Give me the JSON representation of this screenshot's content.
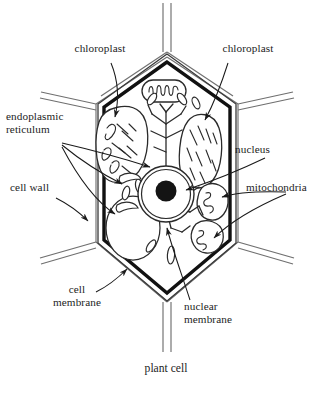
{
  "figure": {
    "title": "plant cell",
    "type": "biological-diagram",
    "subject": "plant cell",
    "background_color": "#ffffff",
    "ink_color": "#1a1a1a"
  },
  "labels": [
    {
      "id": "chloroplast-left",
      "text": "chloroplast",
      "points_to": "chloroplast"
    },
    {
      "id": "chloroplast-right",
      "text": "chloroplast",
      "points_to": "chloroplast"
    },
    {
      "id": "endoplasmic-reticulum",
      "text": "endoplasmic\nreticulum",
      "points_to": "endoplasmic reticulum"
    },
    {
      "id": "cell-wall",
      "text": "cell wall",
      "points_to": "cell wall"
    },
    {
      "id": "cell-membrane",
      "text": "cell\nmembrane",
      "points_to": "cell membrane"
    },
    {
      "id": "nucleus",
      "text": "nucleus",
      "points_to": "nucleus"
    },
    {
      "id": "mitochondria",
      "text": "mitochondria",
      "points_to": "mitochondria"
    },
    {
      "id": "nuclear-membrane",
      "text": "nuclear\nmembrane",
      "points_to": "nuclear membrane"
    }
  ],
  "caption": {
    "text": "plant cell"
  },
  "structures": {
    "cell_wall": "hexagonal outer wall shared with neighbouring cells",
    "cell_membrane": "thick dark line inside the cell wall",
    "nucleus": "circle with double membrane and solid nucleolus",
    "nucleolus": "solid black disc inside nucleus",
    "vacuole": "large pale oval at lower left",
    "chloroplasts": 2,
    "mitochondria": 3,
    "endoplasmic_reticulum": "branching tubular network"
  }
}
